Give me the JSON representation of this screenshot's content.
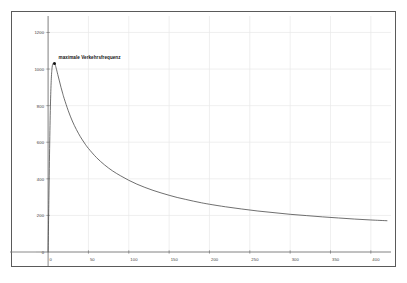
{
  "chart_data": {
    "type": "line",
    "title": "",
    "subtitle": "",
    "xlabel": "",
    "ylabel": "",
    "xlim": [
      -15,
      425
    ],
    "ylim": [
      0,
      1290
    ],
    "grid": true,
    "legend": null,
    "x_ticks": [
      0,
      50,
      100,
      150,
      200,
      250,
      300,
      350,
      400
    ],
    "x_tick_labels": [
      "0",
      "50",
      "100",
      "150",
      "200",
      "250",
      "300",
      "350",
      "400"
    ],
    "y_ticks": [
      0,
      200,
      400,
      600,
      800,
      1000,
      1200
    ],
    "y_tick_labels": [
      "0",
      "200",
      "400",
      "600",
      "800",
      "1000",
      "1200"
    ],
    "series": [
      {
        "name": "Verkehrsfrequenz",
        "color": "#4a4a4a",
        "x": [
          0,
          1,
          2,
          3,
          4,
          5,
          6,
          7,
          8,
          9,
          10,
          12,
          14,
          16,
          18,
          20,
          25,
          30,
          35,
          40,
          45,
          50,
          60,
          70,
          80,
          90,
          100,
          110,
          120,
          130,
          140,
          150,
          160,
          170,
          180,
          190,
          200,
          220,
          240,
          260,
          280,
          300,
          320,
          340,
          360,
          380,
          400,
          420
        ],
        "y": [
          0,
          300,
          600,
          820,
          950,
          1010,
          1030,
          1032,
          1030,
          1020,
          1005,
          970,
          935,
          900,
          868,
          838,
          772,
          716,
          670,
          630,
          596,
          566,
          516,
          476,
          443,
          416,
          392,
          371,
          353,
          337,
          323,
          310,
          298,
          288,
          278,
          269,
          261,
          247,
          235,
          224,
          215,
          206,
          199,
          192,
          186,
          180,
          175,
          171
        ]
      }
    ],
    "annotations": [
      {
        "text": "maximale Verkehrsfrequenz",
        "point_x": 8,
        "point_y": 1030,
        "marker": "dot",
        "marker_color": "#101010"
      }
    ]
  },
  "colors": {
    "frame": "#5a5a5a",
    "axis": "#7d7d7d",
    "grid": "#e8e8e8",
    "curve": "#4a4a4a",
    "text": "#3f3f3f",
    "background": "#ffffff"
  }
}
